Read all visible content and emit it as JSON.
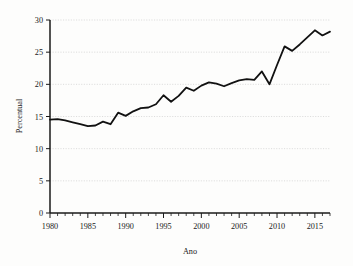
{
  "chart_data": {
    "type": "line",
    "title": "",
    "xlabel": "Ano",
    "ylabel": "Percentual",
    "xlim": [
      1980,
      2017
    ],
    "ylim": [
      0,
      30
    ],
    "grid": true,
    "legend": null,
    "y_ticks": [
      0,
      5,
      10,
      15,
      20,
      25,
      30
    ],
    "x_ticks": [
      1980,
      1985,
      1990,
      1995,
      2000,
      2005,
      2010,
      2015
    ],
    "x_minor_tick_step": 1,
    "line_color": "#111111",
    "grid_color": "#cfcfcf",
    "x": [
      1980,
      1981,
      1982,
      1983,
      1984,
      1985,
      1986,
      1987,
      1988,
      1989,
      1990,
      1991,
      1992,
      1993,
      1994,
      1995,
      1996,
      1997,
      1998,
      1999,
      2000,
      2001,
      2002,
      2003,
      2004,
      2005,
      2006,
      2007,
      2008,
      2009,
      2010,
      2011,
      2012,
      2013,
      2014,
      2015,
      2016,
      2017
    ],
    "values": [
      14.5,
      14.6,
      14.4,
      14.1,
      13.8,
      13.5,
      13.6,
      14.2,
      13.8,
      15.6,
      15.1,
      15.8,
      16.3,
      16.4,
      16.9,
      18.3,
      17.3,
      18.2,
      19.5,
      19.0,
      19.8,
      20.3,
      20.1,
      19.7,
      20.2,
      20.6,
      20.8,
      20.7,
      22.0,
      20.0,
      23.0,
      25.9,
      25.2,
      26.2,
      27.3,
      28.4,
      27.6,
      28.2
    ],
    "series_name": "Percentual"
  }
}
